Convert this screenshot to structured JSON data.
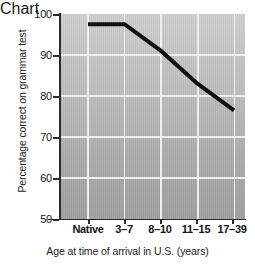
{
  "chart_data": {
    "type": "line",
    "title": "",
    "xlabel": "Age at time of arrival in U.S. (years)",
    "ylabel": "Percentage correct on grammar test",
    "categories": [
      "Native",
      "3–7",
      "8–10",
      "11–15",
      "17–39"
    ],
    "values": [
      97.5,
      97.5,
      91,
      83,
      76.5
    ],
    "ylim": [
      50,
      100
    ],
    "yticks": [
      50,
      60,
      70,
      80,
      90,
      100
    ],
    "ytick_labels": [
      "50",
      "60",
      "70",
      "80",
      "90",
      "100"
    ],
    "grid": true,
    "legend": "none",
    "series": [
      {
        "name": "Percentage correct on grammar test",
        "values": [
          97.5,
          97.5,
          91,
          83,
          76.5
        ]
      }
    ],
    "colors": {
      "line": "#111111",
      "plot_background_top": "#cfcfcf",
      "plot_background_bottom": "#a0a0a0",
      "gridline": "#f2f2f2",
      "axis": "#2b2b2b",
      "text": "#141414",
      "page_background": "#ffffff"
    },
    "line_width_px": 4
  }
}
